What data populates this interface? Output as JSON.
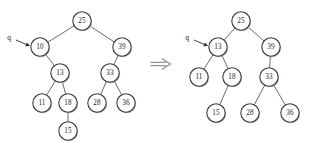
{
  "figure": {
    "kind": "binary-search-tree-transformation-diagram",
    "operator": {
      "name": "implies-arrow",
      "glyph": "⇒",
      "x": 160,
      "y": 64
    },
    "colors": {
      "node_stroke": "#3a3a3d",
      "node_fill": "#ffffff",
      "node_shadow": "#b9b9bd",
      "edge": "#59595c",
      "text": "#1c1c1e",
      "implies": "#8f8f94",
      "background": "#ffffff"
    },
    "node_radius": 9.2,
    "trees": [
      {
        "id": "before-tree",
        "caption": "",
        "pointer": {
          "label": "q",
          "label_x": 9,
          "label_y": 37,
          "target": "10",
          "tail_x": 16,
          "tail_y": 40,
          "tip_x": 30,
          "tip_y": 46
        },
        "nodes": [
          {
            "id": "n25",
            "value": "25",
            "x": 82,
            "y": 21
          },
          {
            "id": "n10",
            "value": "10",
            "x": 40,
            "y": 47
          },
          {
            "id": "n39",
            "value": "39",
            "x": 122,
            "y": 47
          },
          {
            "id": "n13",
            "value": "13",
            "x": 60,
            "y": 73
          },
          {
            "id": "n33",
            "value": "33",
            "x": 110,
            "y": 73
          },
          {
            "id": "n11",
            "value": "11",
            "x": 42,
            "y": 103
          },
          {
            "id": "n18",
            "value": "18",
            "x": 68,
            "y": 103
          },
          {
            "id": "n28",
            "value": "28",
            "x": 97,
            "y": 103
          },
          {
            "id": "n36",
            "value": "36",
            "x": 126,
            "y": 103
          },
          {
            "id": "n15",
            "value": "15",
            "x": 68,
            "y": 131
          }
        ],
        "edges": [
          {
            "from": "n25",
            "to": "n10"
          },
          {
            "from": "n25",
            "to": "n39"
          },
          {
            "from": "n10",
            "to": "n13"
          },
          {
            "from": "n39",
            "to": "n33"
          },
          {
            "from": "n13",
            "to": "n11"
          },
          {
            "from": "n13",
            "to": "n18"
          },
          {
            "from": "n33",
            "to": "n28"
          },
          {
            "from": "n33",
            "to": "n36"
          },
          {
            "from": "n18",
            "to": "n15"
          }
        ]
      },
      {
        "id": "after-tree",
        "caption": "",
        "pointer": {
          "label": "q",
          "label_x": 187,
          "label_y": 37,
          "target": "13",
          "tail_x": 194,
          "tail_y": 40,
          "tip_x": 208,
          "tip_y": 46
        },
        "nodes": [
          {
            "id": "m25",
            "value": "25",
            "x": 241,
            "y": 21
          },
          {
            "id": "m13",
            "value": "13",
            "x": 218,
            "y": 47
          },
          {
            "id": "m39",
            "value": "39",
            "x": 271,
            "y": 47
          },
          {
            "id": "m11",
            "value": "11",
            "x": 199,
            "y": 77
          },
          {
            "id": "m18",
            "value": "18",
            "x": 232,
            "y": 77
          },
          {
            "id": "m33",
            "value": "33",
            "x": 269,
            "y": 77
          },
          {
            "id": "m15",
            "value": "15",
            "x": 216,
            "y": 113
          },
          {
            "id": "m28",
            "value": "28",
            "x": 250,
            "y": 113
          },
          {
            "id": "m36",
            "value": "36",
            "x": 290,
            "y": 113
          }
        ],
        "edges": [
          {
            "from": "m25",
            "to": "m13"
          },
          {
            "from": "m25",
            "to": "m39"
          },
          {
            "from": "m13",
            "to": "m11"
          },
          {
            "from": "m13",
            "to": "m18"
          },
          {
            "from": "m39",
            "to": "m33"
          },
          {
            "from": "m18",
            "to": "m15"
          },
          {
            "from": "m33",
            "to": "m28"
          },
          {
            "from": "m33",
            "to": "m36"
          }
        ]
      }
    ]
  }
}
